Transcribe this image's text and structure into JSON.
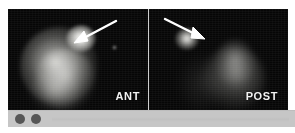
{
  "study": {
    "modality": "scintigraphy",
    "panel_count": 2
  },
  "panels": [
    {
      "id": "ant",
      "label": "ANT",
      "view_name": "anterior",
      "annotation": {
        "type": "arrow",
        "direction": "down-left",
        "points_to": "focal-hot-spot"
      }
    },
    {
      "id": "post",
      "label": "POST",
      "view_name": "posterior",
      "annotation": {
        "type": "arrow",
        "direction": "down-right",
        "points_to": "focal-hot-spot"
      }
    }
  ],
  "toolbar": {
    "dots": [
      {
        "name": "toolbar-dot-1",
        "color": "#565656"
      },
      {
        "name": "toolbar-dot-2",
        "color": "#565656"
      }
    ]
  },
  "colors": {
    "scan_background": "#050505",
    "label_text": "#f2f2f2",
    "arrow": "#ffffff",
    "divider": "#cfcfcf",
    "toolbar_background": "#c6c6c6",
    "toolbar_dot": "#565656",
    "page_background": "#ffffff"
  }
}
